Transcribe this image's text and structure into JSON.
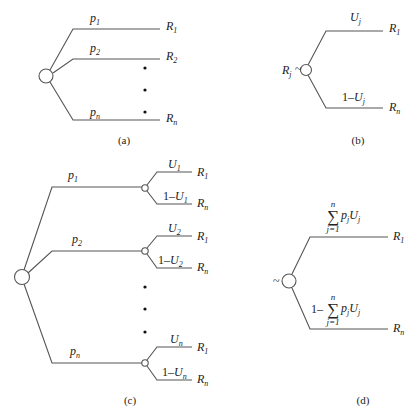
{
  "figure": {
    "panels": [
      {
        "id": "a",
        "caption": "(a)",
        "root_node": "chance-node",
        "branches": [
          {
            "prob": "p",
            "prob_sub": "1",
            "outcome": "R",
            "outcome_sub": "1"
          },
          {
            "prob": "p",
            "prob_sub": "2",
            "outcome": "R",
            "outcome_sub": "2"
          },
          {
            "prob": "p",
            "prob_sub": "n",
            "outcome": "R",
            "outcome_sub": "n"
          }
        ],
        "ellipsis": "•"
      },
      {
        "id": "b",
        "caption": "(b)",
        "root_label": "R",
        "root_label_sub": "j",
        "equiv": "~",
        "branches": [
          {
            "prob": "U",
            "prob_sub": "j",
            "outcome": "R",
            "outcome_sub": "1"
          },
          {
            "prob_prefix": "1–",
            "prob": "U",
            "prob_sub": "j",
            "outcome": "R",
            "outcome_sub": "n"
          }
        ]
      },
      {
        "id": "c",
        "caption": "(c)",
        "branches": [
          {
            "prob": "p",
            "prob_sub": "1",
            "sub_branches": [
              {
                "prob": "U",
                "prob_sub": "1",
                "outcome": "R",
                "outcome_sub": "1"
              },
              {
                "prob_prefix": "1–",
                "prob": "U",
                "prob_sub": "1",
                "outcome": "R",
                "outcome_sub": "n"
              }
            ]
          },
          {
            "prob": "p",
            "prob_sub": "2",
            "sub_branches": [
              {
                "prob": "U",
                "prob_sub": "2",
                "outcome": "R",
                "outcome_sub": "1"
              },
              {
                "prob_prefix": "1–",
                "prob": "U",
                "prob_sub": "2",
                "outcome": "R",
                "outcome_sub": "n"
              }
            ]
          },
          {
            "prob": "p",
            "prob_sub": "n",
            "sub_branches": [
              {
                "prob": "U",
                "prob_sub": "n",
                "outcome": "R",
                "outcome_sub": "1"
              },
              {
                "prob_prefix": "1–",
                "prob": "U",
                "prob_sub": "n",
                "outcome": "R",
                "outcome_sub": "n"
              }
            ]
          }
        ],
        "ellipsis": "•"
      },
      {
        "id": "d",
        "caption": "(d)",
        "equiv": "~",
        "sum": {
          "symbol": "∑",
          "upper": "n",
          "lower": "j=1",
          "term_p": "p",
          "term_p_sub": "j",
          "term_u": "U",
          "term_u_sub": "j"
        },
        "branches": [
          {
            "prob_prefix": "",
            "outcome": "R",
            "outcome_sub": "1"
          },
          {
            "prob_prefix": "1–",
            "outcome": "R",
            "outcome_sub": "n"
          }
        ]
      }
    ]
  }
}
